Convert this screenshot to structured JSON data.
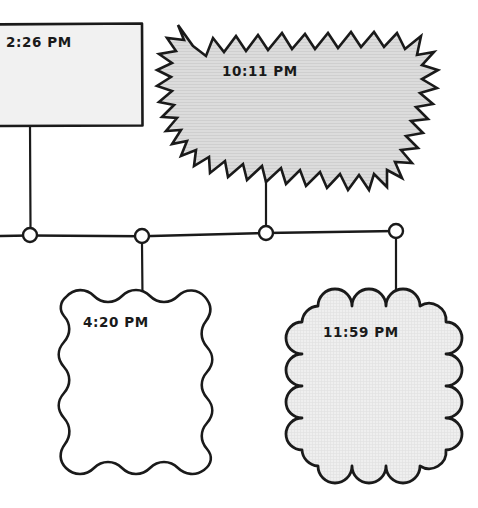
{
  "diagram": {
    "background_color": "#ffffff",
    "stroke_color": "#1a1a1a",
    "nodes": [
      {
        "id": "node-rectangle",
        "shape": "rectangle",
        "label": "2:26 PM",
        "fill": "#f0f0f0",
        "label_x": 6,
        "label_y": 47
      },
      {
        "id": "node-starburst",
        "shape": "starburst",
        "label": "10:11 PM",
        "fill": "#d6d6d6",
        "label_x": 222,
        "label_y": 76
      },
      {
        "id": "node-wavy",
        "shape": "wavy-rectangle",
        "label": "4:20 PM",
        "fill": "#ffffff",
        "label_x": 83,
        "label_y": 327
      },
      {
        "id": "node-cloud",
        "shape": "cloud",
        "label": "11:59 PM",
        "fill": "#ececec",
        "label_x": 323,
        "label_y": 337
      }
    ],
    "junctions": [
      {
        "id": "junction-1",
        "cx": 30,
        "cy": 235,
        "r": 7
      },
      {
        "id": "junction-2",
        "cx": 142,
        "cy": 236,
        "r": 7
      },
      {
        "id": "junction-3",
        "cx": 266,
        "cy": 233,
        "r": 7
      },
      {
        "id": "junction-4",
        "cx": 396,
        "cy": 231,
        "r": 7
      }
    ],
    "connectors": [
      {
        "id": "connector-bus",
        "kind": "horizontal-bus"
      },
      {
        "id": "connector-rect-down",
        "kind": "vertical"
      },
      {
        "id": "connector-starburst-down",
        "kind": "vertical"
      },
      {
        "id": "connector-wavy-up",
        "kind": "vertical"
      },
      {
        "id": "connector-cloud-up",
        "kind": "vertical"
      }
    ]
  }
}
